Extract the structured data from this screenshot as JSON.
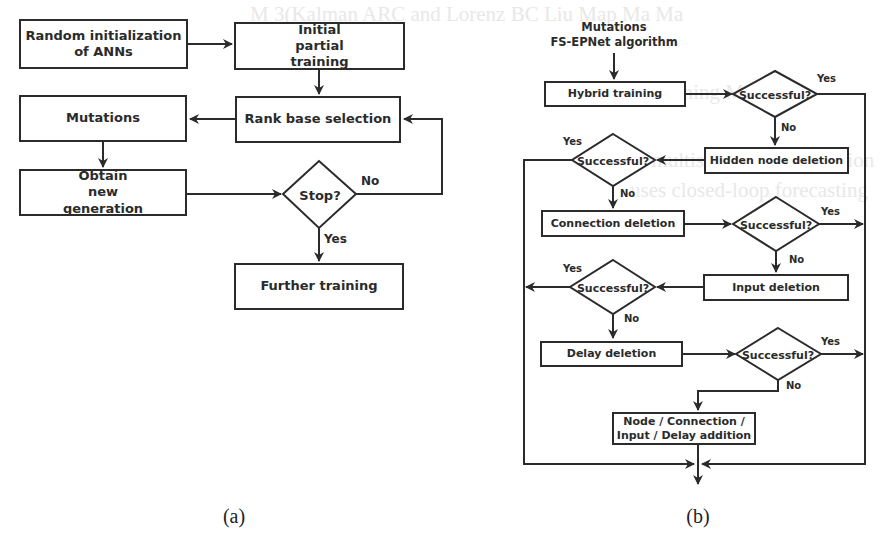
{
  "bleed_through": [
    {
      "text": "M   3(Kalman  ARC and Lorenz  BC   Liu  Map  Ma  Ma",
      "x": 250,
      "y": 4
    },
    {
      "text": "Hybrid  training  M MSP",
      "x": 590,
      "y": 80
    },
    {
      "text": "uses   multistep   ahead   prediction",
      "x": 610,
      "y": 150
    },
    {
      "text": "uses   closed-loop   forecasting",
      "x": 630,
      "y": 180
    }
  ],
  "panel_a": {
    "caption": "(a)",
    "nodes": {
      "random_init": "Random initialization of ANNs",
      "initial_training": "Initial partial training",
      "rank_selection": "Rank base selection",
      "mutations": "Mutations",
      "obtain_generation": "Obtain new generation",
      "stop": "Stop?",
      "further_training": "Further training"
    },
    "edge_labels": {
      "stop_no": "No",
      "stop_yes": "Yes"
    }
  },
  "panel_b": {
    "caption": "(b)",
    "title_line1": "Mutations",
    "title_line2": "FS-EPNet algorithm",
    "nodes": {
      "hybrid_training": "Hybrid training",
      "hidden_node_deletion": "Hidden node deletion",
      "connection_deletion": "Connection deletion",
      "input_deletion": "Input deletion",
      "delay_deletion": "Delay deletion",
      "addition_line1": "Node / Connection /",
      "addition_line2": "Input / Delay addition"
    },
    "decisions": [
      {
        "label": "Successful?",
        "yes": "Yes",
        "no": "No"
      },
      {
        "label": "Successful?",
        "yes": "Yes",
        "no": "No"
      },
      {
        "label": "Successful?",
        "yes": "Yes",
        "no": "No"
      },
      {
        "label": "Successful?",
        "yes": "Yes",
        "no": "No"
      },
      {
        "label": "Successful?",
        "yes": "Yes",
        "no": "No"
      }
    ]
  },
  "colors": {
    "stroke": "#2b2b2b",
    "background": "#ffffff"
  }
}
